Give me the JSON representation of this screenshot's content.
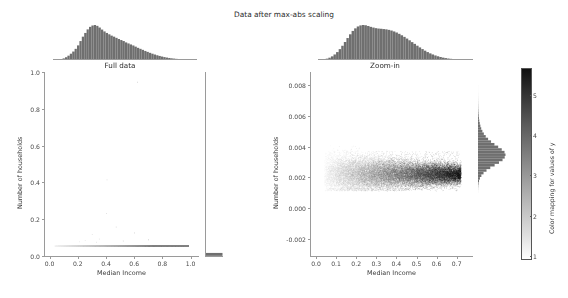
{
  "figure": {
    "suptitle": "Data after max-abs scaling",
    "background_color": "#ffffff",
    "text_color": "#3a3a3a"
  },
  "colorbar": {
    "label": "Color mapping for values of y",
    "ticks": [
      "1",
      "2",
      "3",
      "4",
      "5"
    ],
    "tick_values": [
      1,
      2,
      3,
      4,
      5
    ],
    "vmin": 0.4,
    "vmax": 5.1,
    "cmap": "Greys",
    "low_color": "#ffffff",
    "high_color": "#101010"
  },
  "chart_data": [
    {
      "type": "scatter",
      "panel": "left",
      "title": "Full data",
      "xlabel": "Median Income",
      "ylabel": "Number of households",
      "xlim": [
        -0.04,
        1.06
      ],
      "ylim": [
        -0.06,
        1.06
      ],
      "xticks": [
        0.0,
        0.2,
        0.4,
        0.6,
        0.8,
        1.0
      ],
      "xticklabels": [
        "0.0",
        "0.2",
        "0.4",
        "0.6",
        "0.8",
        "1.0"
      ],
      "yticks": [
        0.0,
        0.2,
        0.4,
        0.6,
        0.8,
        1.0
      ],
      "yticklabels": [
        "0.0",
        "0.2",
        "0.4",
        "0.6",
        "0.8",
        "1.0"
      ],
      "grid": false,
      "legend": "none",
      "n_points": 20640,
      "description": "Nearly all points collapse onto a thin horizontal strip at y near 0.002, spread across x from 0.03 to 1.0; a handful of outliers rise to y = 0.2, 0.4 and 1.0.",
      "marginal_x_hist": {
        "orientation": "vertical-bars",
        "bins": 60,
        "counts": [
          2,
          5,
          12,
          26,
          48,
          82,
          128,
          186,
          250,
          330,
          432,
          560,
          690,
          800,
          905,
          980,
          1020,
          1035,
          1010,
          960,
          900,
          845,
          800,
          760,
          720,
          690,
          655,
          620,
          590,
          560,
          520,
          490,
          460,
          430,
          395,
          360,
          330,
          300,
          268,
          240,
          212,
          186,
          162,
          140,
          120,
          102,
          86,
          72,
          60,
          50,
          42,
          34,
          28,
          22,
          18,
          14,
          11,
          8,
          6,
          4
        ]
      },
      "marginal_y_hist": {
        "orientation": "horizontal-bars",
        "bins": 60,
        "counts": [
          20600,
          18,
          8,
          5,
          3,
          2,
          2,
          1,
          1,
          1,
          1,
          1,
          0,
          0,
          0,
          0,
          0,
          0,
          0,
          0,
          0,
          0,
          0,
          0,
          0,
          0,
          0,
          0,
          0,
          0,
          0,
          0,
          0,
          0,
          0,
          0,
          0,
          0,
          0,
          0,
          0,
          0,
          0,
          0,
          0,
          0,
          0,
          0,
          0,
          0,
          0,
          0,
          0,
          0,
          0,
          0,
          0,
          0,
          0,
          1
        ]
      }
    },
    {
      "type": "scatter",
      "panel": "right",
      "title": "Zoom-in",
      "xlabel": "Median Income",
      "ylabel": "Number of households",
      "xlim": [
        -0.03,
        0.78
      ],
      "ylim": [
        -0.0032,
        0.0088
      ],
      "xticks": [
        0.0,
        0.1,
        0.2,
        0.3,
        0.4,
        0.5,
        0.6,
        0.7
      ],
      "xticklabels": [
        "0.0",
        "0.1",
        "0.2",
        "0.3",
        "0.4",
        "0.5",
        "0.6",
        "0.7"
      ],
      "yticks": [
        -0.002,
        0.0,
        0.002,
        0.004,
        0.006,
        0.008
      ],
      "yticklabels": [
        "-0.002",
        "0.000",
        "0.002",
        "0.004",
        "0.006",
        "0.008"
      ],
      "grid": false,
      "legend": "none",
      "n_points": 20000,
      "description": "Dense cloud centered at y about 0.002 spanning x from 0.04 to 0.72, vertically bounded between 0.001 and 0.004; point color runs light gray on the left to near black on the right, encoding y-values 1 to 5.",
      "cloud": {
        "x_start": 0.04,
        "x_end": 0.72,
        "y_center": 0.00215,
        "y_spread_low": 0.00105,
        "y_spread_high": 0.00405
      },
      "marginal_x_hist": {
        "orientation": "vertical-bars",
        "bins": 60,
        "counts": [
          3,
          8,
          18,
          34,
          58,
          92,
          140,
          200,
          275,
          360,
          455,
          555,
          650,
          735,
          800,
          848,
          875,
          885,
          878,
          860,
          838,
          820,
          805,
          795,
          790,
          782,
          775,
          762,
          745,
          722,
          695,
          662,
          625,
          585,
          542,
          498,
          452,
          408,
          362,
          318,
          276,
          236,
          200,
          168,
          140,
          115,
          94,
          76,
          60,
          48,
          38,
          30,
          23,
          18,
          14,
          11,
          8,
          6,
          4,
          3
        ]
      },
      "marginal_y_hist": {
        "orientation": "horizontal-bars",
        "bins": 70,
        "counts": [
          0,
          0,
          0,
          0,
          0,
          0,
          0,
          0,
          0,
          0,
          0,
          0,
          0,
          0,
          0,
          0,
          0,
          0,
          0,
          0,
          0,
          0,
          0,
          0,
          2,
          5,
          12,
          26,
          52,
          98,
          170,
          280,
          430,
          620,
          840,
          1060,
          1240,
          1350,
          1390,
          1340,
          1200,
          1020,
          830,
          660,
          510,
          390,
          295,
          220,
          162,
          120,
          88,
          64,
          46,
          33,
          24,
          17,
          12,
          9,
          6,
          4,
          3,
          2,
          1,
          1,
          1,
          0,
          0,
          0,
          0,
          0
        ]
      }
    }
  ]
}
